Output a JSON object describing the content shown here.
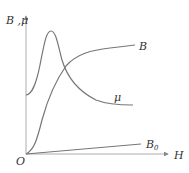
{
  "diagram": {
    "title": "",
    "axes": {
      "y_label_B": "B",
      "y_label_sep": " ,",
      "y_label_mu": "μ",
      "x_label": "H",
      "origin_label": "O"
    },
    "curves": [
      {
        "name": "B",
        "label": "B",
        "description": "magnetization curve of ferromagnetic material, rising and saturating"
      },
      {
        "name": "mu",
        "label": "μ",
        "description": "permeability curve, rises to a peak then decreases"
      },
      {
        "name": "B0",
        "label": "B",
        "label_sub": "0",
        "description": "vacuum B = μ0 H, straight line"
      }
    ],
    "colors": {
      "curve": "#777777",
      "axis": "#888888",
      "text": "#333333"
    }
  }
}
